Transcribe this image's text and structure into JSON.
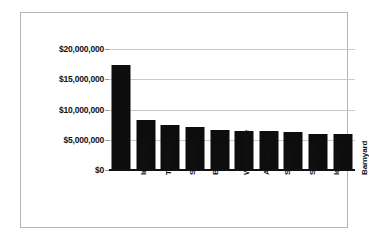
{
  "chart_data": {
    "type": "bar",
    "title": "",
    "xlabel": "",
    "ylabel": "",
    "categories": [
      "Invincible",
      "Talladega",
      "Sunshine",
      "Beerfest",
      "World Trade",
      "Accepted",
      "Snakes",
      "Step Up",
      "Idlewild",
      "Barnyard"
    ],
    "values": [
      17300000,
      8200000,
      7400000,
      7100000,
      6600000,
      6500000,
      6400000,
      6300000,
      6000000,
      6000000
    ],
    "ylim": [
      0,
      20000000
    ],
    "ytick_values": [
      20000000,
      15000000,
      10000000,
      5000000,
      0
    ],
    "ytick_labels": [
      "$20,000,000",
      "$15,000,000",
      "$10,000,000",
      "$5,000,000",
      "$0"
    ],
    "grid": true,
    "legend": null,
    "bar_color": "#0d0d0d",
    "grid_color": "#c9c9c9",
    "axis_color": "#111111",
    "frame_color": "#b3b3b3",
    "background_color": "#ffffff"
  }
}
